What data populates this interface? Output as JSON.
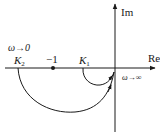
{
  "diagram": {
    "type": "nyquist-plot",
    "axes": {
      "real_label": "Re",
      "imag_label": "Im"
    },
    "points": {
      "k2_label": "K",
      "k2_sub": "2",
      "minus_one_label": "−1",
      "k1_label": "K",
      "k1_sub": "1"
    },
    "annotations": {
      "omega_zero": "ω→0",
      "omega_inf": "ω→∞"
    },
    "curves": [
      {
        "name": "large-curve",
        "from": "K2",
        "to": "origin",
        "direction": "clockwise-below"
      },
      {
        "name": "small-curve",
        "from": "K1",
        "to": "origin",
        "direction": "clockwise-below"
      }
    ],
    "colors": {
      "line": "#1a1a1a"
    }
  }
}
